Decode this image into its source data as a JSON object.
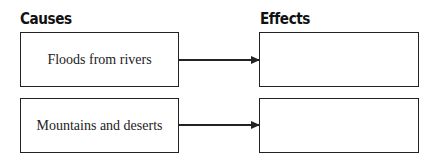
{
  "headings": {
    "causes": "Causes",
    "effects": "Effects"
  },
  "rows": [
    {
      "cause": "Floods from rivers",
      "effect": ""
    },
    {
      "cause": "Mountains and deserts",
      "effect": ""
    }
  ]
}
